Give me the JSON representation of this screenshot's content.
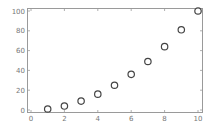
{
  "chart_data": {
    "type": "scatter",
    "title": "",
    "xlabel": "",
    "ylabel": "",
    "x": [
      1,
      2,
      3,
      4,
      5,
      6,
      7,
      8,
      9,
      10
    ],
    "y": [
      1,
      4,
      9,
      16,
      25,
      36,
      49,
      64,
      81,
      100
    ],
    "series": [
      {
        "name": "",
        "x": [
          1,
          2,
          3,
          4,
          5,
          6,
          7,
          8,
          9,
          10
        ],
        "values": [
          1,
          4,
          9,
          16,
          25,
          36,
          49,
          64,
          81,
          100
        ]
      }
    ],
    "xlim": [
      0,
      10
    ],
    "ylim": [
      0,
      100
    ],
    "xticks": [
      "0",
      "2",
      "4",
      "6",
      "8",
      "10"
    ],
    "yticks": [
      "0",
      "20",
      "40",
      "60",
      "80",
      "100"
    ],
    "grid": false,
    "legend": null,
    "marker": "open-circle",
    "colors": {
      "frame": "#9a9a9a",
      "marker": "#444444",
      "tick_label": "#777777"
    }
  }
}
